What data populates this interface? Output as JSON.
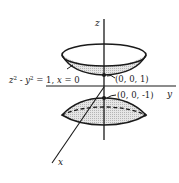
{
  "diagram": {
    "type": "hyperboloid-of-two-sheets",
    "axes": {
      "z_label": "z",
      "y_label": "y",
      "x_label": "x"
    },
    "trace_label": {
      "z": "z",
      "sup1": "2",
      "minus": " - ",
      "y": "y",
      "sup2": "2",
      "rest": " = 1, ",
      "x": "x",
      "eq": " = 0"
    },
    "points": [
      {
        "label": "(0, 0, 1)"
      },
      {
        "label": "(0, 0, -1)"
      }
    ],
    "colors": {
      "ink": "#1a1a1a",
      "shade": "#cfcfcf",
      "background": "#ffffff"
    }
  }
}
